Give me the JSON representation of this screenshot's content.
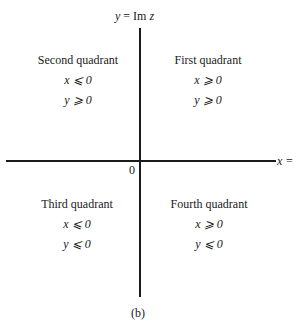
{
  "diagram": {
    "y_axis_label": {
      "var": "y",
      "eq": " = Im ",
      "z": "z"
    },
    "x_axis_label": "x =",
    "origin_label": "0",
    "caption": "(b)",
    "quadrants": [
      {
        "id": "second",
        "title": "Second quadrant",
        "cond1": "x ⩽ 0",
        "cond2": "y ⩾ 0"
      },
      {
        "id": "first",
        "title": "First quadrant",
        "cond1": "x ⩾ 0",
        "cond2": "y ⩾ 0"
      },
      {
        "id": "third",
        "title": "Third quadrant",
        "cond1": "x ⩽ 0",
        "cond2": "y ⩽ 0"
      },
      {
        "id": "fourth",
        "title": "Fourth quadrant",
        "cond1": "x ⩾ 0",
        "cond2": "y ⩽ 0"
      }
    ]
  }
}
